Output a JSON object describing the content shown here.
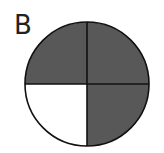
{
  "figure": {
    "label": "B",
    "shape": "circle",
    "divisions": 4,
    "shaded_quadrants": [
      "top-left",
      "top-right",
      "bottom-right"
    ],
    "unshaded_quadrants": [
      "bottom-left"
    ],
    "shaded_fraction": "3/4",
    "colors": {
      "shaded": "#585858",
      "unshaded": "#ffffff",
      "stroke": "#111111"
    }
  }
}
